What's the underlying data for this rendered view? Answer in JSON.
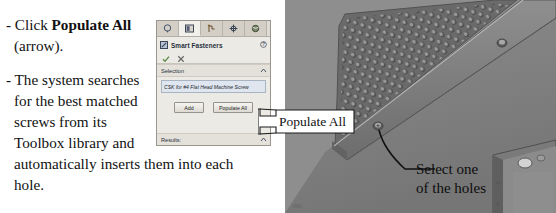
{
  "instructions": {
    "bullet1": {
      "prefix": "- Click ",
      "bold": "Populate All",
      "suffix": "(arrow)."
    },
    "bullet2": {
      "line1": "- The system searches",
      "line2": "for the best matched",
      "line3": "screws from its",
      "line4": "Toolbox library and",
      "line5": "automatically inserts them into each",
      "line6": "hole."
    }
  },
  "panel": {
    "tabs": [
      {
        "name": "feature-manager-tab",
        "icon": "tree-icon"
      },
      {
        "name": "property-manager-tab",
        "icon": "panel-icon"
      },
      {
        "name": "configuration-manager-tab",
        "icon": "config-icon"
      },
      {
        "name": "dimxpert-manager-tab",
        "icon": "crosshair-icon"
      },
      {
        "name": "display-manager-tab",
        "icon": "sphere-icon"
      }
    ],
    "title": "Smart Fasteners",
    "help_icon": "question-icon",
    "accept_icon": "checkmark-icon",
    "cancel_icon": "x-icon",
    "selection": {
      "header": "Selection",
      "collapse_icon": "chevron-up-icon",
      "value": "CSK for #4 Flat Head Machine Screw"
    },
    "buttons": {
      "add": "Add",
      "populate_all": "Populate All"
    },
    "results": {
      "header": "Results:",
      "collapse_icon": "chevron-up-icon"
    }
  },
  "callout": {
    "label": "Populate All",
    "shape": "left-arrow-banner"
  },
  "viewport": {
    "annotation": {
      "line1": "Select one",
      "line2": "of the holes"
    },
    "parts": [
      "perforated-sheet-metal-panel",
      "flange-edge",
      "countersunk-hole",
      "corner-bracket"
    ]
  },
  "colors": {
    "viewport_bg": "#8e8e8e",
    "metal_face": "#7b7b7b",
    "metal_dark": "#5e5e5e",
    "metal_light": "#a5a5a5",
    "panel_bg": "#eceae4",
    "selection_field": "#dfe6ef",
    "callout_fill": "#ffffff"
  }
}
